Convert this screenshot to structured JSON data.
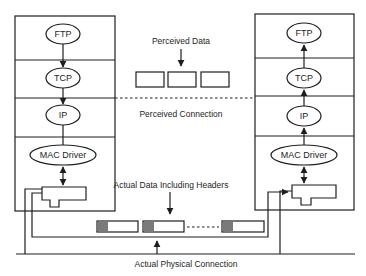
{
  "diagram": {
    "left_stack": {
      "layers": [
        {
          "label": "FTP"
        },
        {
          "label": "TCP"
        },
        {
          "label": "IP"
        },
        {
          "label": "MAC Driver"
        }
      ]
    },
    "right_stack": {
      "layers": [
        {
          "label": "FTP"
        },
        {
          "label": "TCP"
        },
        {
          "label": "IP"
        },
        {
          "label": "MAC Driver"
        }
      ]
    },
    "captions": {
      "perceived_data": "Perceived Data",
      "perceived_connection": "Perceived Connection",
      "actual_data": "Actual Data Including Headers",
      "actual_physical": "Actual Physical Connection"
    },
    "colors": {
      "line": "#1e1e1e",
      "header_fill": "#7a7a7a",
      "background": "#ffffff"
    }
  }
}
